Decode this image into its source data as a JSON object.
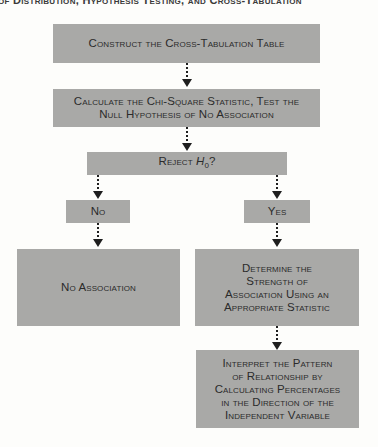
{
  "header": {
    "text": "of Distribution, Hypothesis Testing, and Cross-Tabulation"
  },
  "flowchart": {
    "steps": {
      "construct": {
        "label": "Construct the Cross-Tabulation Table"
      },
      "calculate": {
        "line1": "Calculate the Chi-Square Statistic, Test the",
        "line2": "Null Hypothesis of No Association"
      },
      "decision": {
        "prefix": "Reject ",
        "symbol": "H",
        "subscript": "0",
        "suffix": "?"
      },
      "no": {
        "label": "No"
      },
      "yes": {
        "label": "Yes"
      },
      "no_association": {
        "label": "No Association"
      },
      "strength": {
        "lines": [
          "Determine the",
          "Strength of",
          "Association Using an",
          "Appropriate Statistic"
        ]
      },
      "interpret": {
        "lines": [
          "Interpret the Pattern",
          "of Relationship by",
          "Calculating Percentages",
          "in the Direction of the",
          "Independent Variable"
        ]
      }
    },
    "colors": {
      "box_fill": "#a9a9a7",
      "text": "#2b2b2b",
      "arrow": "#1e1e1e",
      "background": "#fdfdfb"
    }
  }
}
